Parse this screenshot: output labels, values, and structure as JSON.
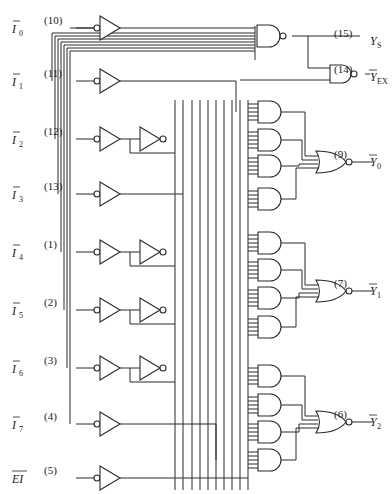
{
  "diagram": {
    "type": "logic-circuit",
    "inputs": [
      {
        "name": "I",
        "sub": "0",
        "pin": "(10)",
        "y": 28
      },
      {
        "name": "I",
        "sub": "1",
        "pin": "(11)",
        "y": 81
      },
      {
        "name": "I",
        "sub": "2",
        "pin": "(12)",
        "y": 139
      },
      {
        "name": "I",
        "sub": "3",
        "pin": "(13)",
        "y": 194
      },
      {
        "name": "I",
        "sub": "4",
        "pin": "(1)",
        "y": 252
      },
      {
        "name": "I",
        "sub": "5",
        "pin": "(2)",
        "y": 310
      },
      {
        "name": "I",
        "sub": "6",
        "pin": "(3)",
        "y": 368
      },
      {
        "name": "I",
        "sub": "7",
        "pin": "(4)",
        "y": 424
      },
      {
        "name": "EI",
        "sub": "",
        "pin": "(5)",
        "y": 478
      }
    ],
    "outputs": [
      {
        "name": "Y",
        "sub": "S",
        "pin": "(15)",
        "overbar": false,
        "y": 41
      },
      {
        "name": "Y",
        "sub": "EX",
        "pin": "(14)",
        "overbar": true,
        "y": 77
      },
      {
        "name": "Y",
        "sub": "0",
        "pin": "(9)",
        "overbar": true,
        "y": 162
      },
      {
        "name": "Y",
        "sub": "1",
        "pin": "(7)",
        "overbar": true,
        "y": 291
      },
      {
        "name": "Y",
        "sub": "2",
        "pin": "(6)",
        "overbar": true,
        "y": 422
      }
    ],
    "gates": {
      "input_buffers": 8,
      "inverters": 4,
      "and_gates": 12,
      "nor_gates": 3,
      "nand_gates": 2
    }
  }
}
